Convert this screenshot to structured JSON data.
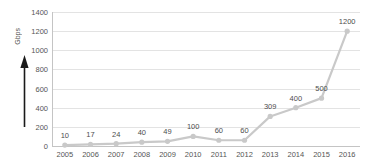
{
  "chart_data": {
    "type": "line",
    "title": "",
    "xlabel": "",
    "ylabel": "Gbps",
    "categories": [
      "2005",
      "2006",
      "2007",
      "2008",
      "2009",
      "2010",
      "2011",
      "2012",
      "2013",
      "2014",
      "2015",
      "2016"
    ],
    "values": [
      10,
      17,
      24,
      40,
      49,
      100,
      60,
      60,
      309,
      400,
      500,
      1200
    ],
    "data_labels": [
      "10",
      "17",
      "24",
      "40",
      "49",
      "100",
      "60",
      "60",
      "309",
      "400",
      "500",
      "1200"
    ],
    "ylim": [
      0,
      1400
    ],
    "yticks": [
      0,
      200,
      400,
      600,
      800,
      1000,
      1200,
      1400
    ],
    "ytick_labels": [
      "0",
      "200",
      "400",
      "600",
      "800",
      "1000",
      "1200",
      "1400"
    ],
    "grid": true,
    "legend": false,
    "legend_position": "none",
    "series": [
      {
        "name": "Gbps",
        "values": [
          10,
          17,
          24,
          40,
          49,
          100,
          60,
          60,
          309,
          400,
          500,
          1200
        ],
        "line_color": "#c9c9c9",
        "marker_color": "#c9c9c9",
        "marker": "circle"
      }
    ],
    "annotations": [
      {
        "name": "growth-arrow",
        "type": "arrow",
        "direction": "up",
        "color": "#1a1a1a"
      }
    ],
    "colors": {
      "series": "#c9c9c9",
      "gridline": "#e3e3e3",
      "axis": "#c4c4c4",
      "text": "#555555",
      "label_text": "#4d4d4d",
      "background": "#ffffff",
      "arrow": "#1a1a1a"
    }
  }
}
